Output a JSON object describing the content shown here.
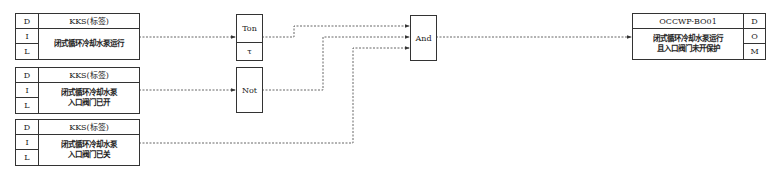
{
  "inputs": [
    {
      "flags": [
        "D",
        "I",
        "L"
      ],
      "tag": "KKS(标签)",
      "desc": "闭式循环冷却水泵运行"
    },
    {
      "flags": [
        "D",
        "I",
        "L"
      ],
      "tag": "KKS(标签)",
      "desc": "闭式循环冷却水泵\n入口阀门已开"
    },
    {
      "flags": [
        "D",
        "I",
        "L"
      ],
      "tag": "KKS(标签)",
      "desc": "闭式循环冷却水泵\n入口阀门已关"
    }
  ],
  "gates": {
    "ton": {
      "label": "Ton",
      "param": "τ"
    },
    "not": {
      "label": "Not"
    },
    "and": {
      "label": "And"
    }
  },
  "output": {
    "tag": "OCCWP-BO01",
    "desc": "闭式循环冷却水泵运行\n且入口阀门未开保护",
    "flags": [
      "D",
      "O",
      "M"
    ]
  },
  "colors": {
    "line": "#333333",
    "wire": "#555555"
  }
}
